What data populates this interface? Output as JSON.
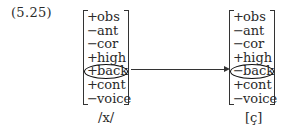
{
  "equation_number": "(5.25)",
  "left_matrix": {
    "features": [
      {
        "sign": "+",
        "name": "obs"
      },
      {
        "sign": "−",
        "name": "ant"
      },
      {
        "sign": "−",
        "name": "cor"
      },
      {
        "sign": "+",
        "name": "high"
      },
      {
        "sign": "+",
        "name": "back",
        "circled": true
      },
      {
        "sign": "+",
        "name": "cont"
      },
      {
        "sign": "−",
        "name": "voice"
      }
    ],
    "segment_label": "/x/"
  },
  "right_matrix": {
    "features": [
      {
        "sign": "+",
        "name": "obs"
      },
      {
        "sign": "−",
        "name": "ant"
      },
      {
        "sign": "−",
        "name": "cor"
      },
      {
        "sign": "+",
        "name": "high"
      },
      {
        "sign": "−",
        "name": "back",
        "circled": true
      },
      {
        "sign": "+",
        "name": "cont"
      },
      {
        "sign": "−",
        "name": "voice"
      }
    ],
    "segment_label": "[ç]"
  },
  "arrow": {
    "from": "left_matrix.back",
    "to": "right_matrix.back"
  }
}
